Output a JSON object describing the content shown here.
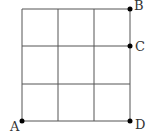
{
  "diagram": {
    "type": "grid",
    "rows": 3,
    "cols": 3,
    "points": [
      {
        "id": "A",
        "label": "A",
        "position": "bottom-left corner"
      },
      {
        "id": "B",
        "label": "B",
        "position": "top-right corner"
      },
      {
        "id": "C",
        "label": "C",
        "position": "right edge, one square down from top"
      },
      {
        "id": "D",
        "label": "D",
        "position": "bottom-right corner"
      }
    ],
    "line_color": "#444444",
    "point_color": "#000000"
  }
}
